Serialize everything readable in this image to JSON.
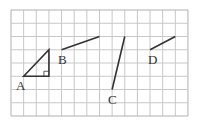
{
  "grid": {
    "x0": 11,
    "y0": 10,
    "cols": 14,
    "rows": 8,
    "cell_w": 12.64,
    "cell_h": 13.25,
    "line_color": "#c8c8c8",
    "border_color": "#b0b0b0"
  },
  "colors": {
    "stroke": "#333333"
  },
  "figures": {
    "A": {
      "label": "A",
      "type": "right-triangle",
      "points": [
        [
          1,
          5
        ],
        [
          3,
          3
        ],
        [
          3,
          5
        ]
      ],
      "label_pos": [
        16,
        90
      ]
    },
    "B": {
      "label": "B",
      "type": "segment",
      "points": [
        [
          4,
          3
        ],
        [
          7,
          2
        ]
      ],
      "label_pos": [
        58,
        64
      ]
    },
    "C": {
      "label": "C",
      "type": "segment",
      "points": [
        [
          9,
          2
        ],
        [
          8,
          6
        ]
      ],
      "label_pos": [
        108,
        104
      ]
    },
    "D": {
      "label": "D",
      "type": "segment",
      "points": [
        [
          11,
          3
        ],
        [
          13,
          2
        ]
      ],
      "label_pos": [
        148,
        64
      ]
    }
  }
}
